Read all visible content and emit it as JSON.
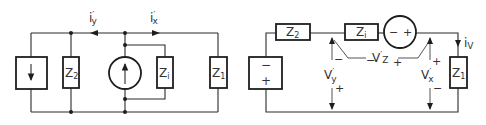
{
  "figure": {
    "left_circuit": {
      "name": "current-source equivalent network",
      "components": {
        "dependent_current_source_left": {
          "type": "current source (box)",
          "direction": "down"
        },
        "z2": {
          "label": "Z",
          "sub": "2"
        },
        "current_source_center": {
          "type": "current source (circle)",
          "direction": "up"
        },
        "zi": {
          "label": "Z",
          "sub": "i"
        },
        "z1": {
          "label": "Z",
          "sub": "1"
        }
      },
      "currents": {
        "iy": {
          "label": "i",
          "prime": "′",
          "sub": "y",
          "direction": "left"
        },
        "ix": {
          "label": "i",
          "prime": "′",
          "sub": "x",
          "direction": "right"
        }
      }
    },
    "right_circuit": {
      "name": "voltage-source equivalent network",
      "components": {
        "voltage_source_box": {
          "minus": "−",
          "plus": "+"
        },
        "z2": {
          "label": "Z",
          "sub": "2"
        },
        "zi": {
          "label": "Z",
          "sub": "i"
        },
        "voltage_source_circle": {
          "minus": "−",
          "plus": "+"
        },
        "z1": {
          "label": "Z",
          "sub": "1"
        }
      },
      "current": {
        "label": "i",
        "sub": "V",
        "direction": "down"
      },
      "voltages": {
        "vz": {
          "label": "V",
          "prime": "′",
          "sub": "Z",
          "minus": "−",
          "plus": "+"
        },
        "vy": {
          "label": "V",
          "prime": "′",
          "sub": "y",
          "minus": "−",
          "plus": "+"
        },
        "vx": {
          "label": "V",
          "prime": "′",
          "sub": "x",
          "plus": "+",
          "minus": "−"
        }
      }
    },
    "colors": {
      "line": "#1e1e1e",
      "text": "#333333",
      "background": "#ffffff"
    }
  }
}
